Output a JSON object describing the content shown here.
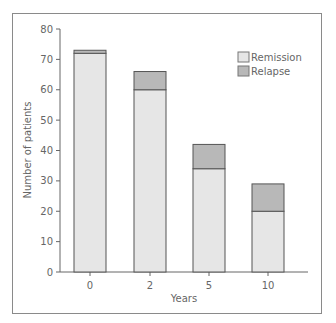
{
  "chart_data": {
    "type": "bar",
    "stacked": true,
    "title": "",
    "xlabel": "Years",
    "ylabel": "Number of patients",
    "categories": [
      "0",
      "2",
      "5",
      "10"
    ],
    "series": [
      {
        "name": "Remission",
        "values": [
          72,
          60,
          34,
          20
        ],
        "color": "#e6e6e6"
      },
      {
        "name": "Relapse",
        "values": [
          1,
          6,
          8,
          9
        ],
        "color": "#b8b8b8"
      }
    ],
    "ylim": [
      0,
      80
    ],
    "yticks": [
      0,
      10,
      20,
      30,
      40,
      50,
      60,
      70,
      80
    ],
    "grid": false,
    "legend_position": "upper right"
  },
  "legend": {
    "items": [
      {
        "label": "Remission",
        "color": "#e6e6e6"
      },
      {
        "label": "Relapse",
        "color": "#b8b8b8"
      }
    ]
  },
  "colors": {
    "bar_outline": "#555555",
    "axis": "#666666",
    "frame": "#8a8a8a"
  }
}
